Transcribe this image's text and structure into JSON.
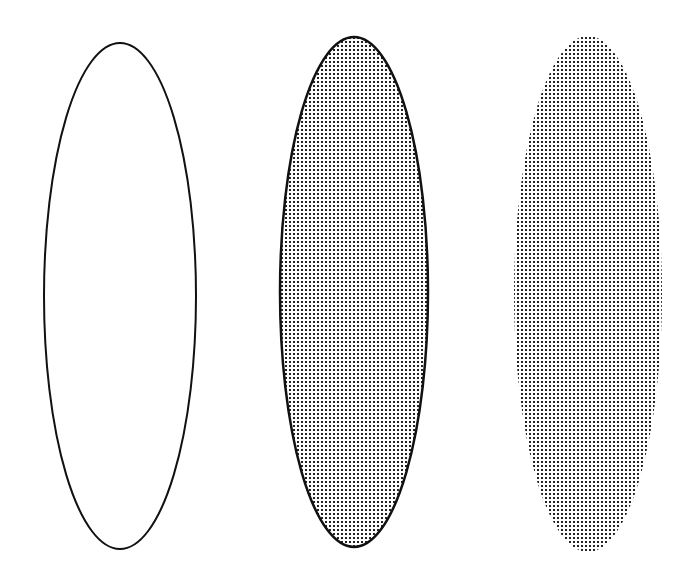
{
  "canvas": {
    "width": 694,
    "height": 582,
    "background": "#ffffff"
  },
  "colors": {
    "stroke": "#111111",
    "dot": "#222222",
    "background": "#ffffff"
  },
  "pattern": {
    "spacing": 4,
    "dot_size": 2
  },
  "ellipses": [
    {
      "name": "outline-only",
      "cx": 120,
      "cy": 296,
      "rx": 76,
      "ry": 253,
      "stroke": true,
      "fill": false
    },
    {
      "name": "outline-and-fill",
      "cx": 354,
      "cy": 292,
      "rx": 74,
      "ry": 255,
      "stroke": true,
      "fill": true
    },
    {
      "name": "fill-only",
      "cx": 588,
      "cy": 294,
      "rx": 74,
      "ry": 258,
      "stroke": false,
      "fill": true
    }
  ]
}
